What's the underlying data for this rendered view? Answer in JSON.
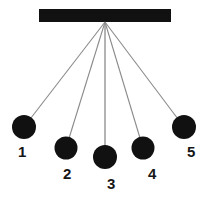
{
  "figure": {
    "type": "physics-diagram",
    "width": 210,
    "height": 199,
    "background_color": "#ffffff"
  },
  "support_bar": {
    "name": "horizontal support bar",
    "color": "#111111",
    "x": 39,
    "y": 9,
    "width": 132,
    "height": 13
  },
  "pivot": {
    "name": "common suspension point",
    "x": 105,
    "y": 22
  },
  "string": {
    "color": "#8a8a8a",
    "width": 1.1
  },
  "bob_color": "#111111",
  "pendulums": [
    {
      "label": "1",
      "bob_cx": 24,
      "bob_cy": 127,
      "bob_r": 12,
      "label_x": 18,
      "label_y": 157
    },
    {
      "label": "2",
      "bob_cx": 66,
      "bob_cy": 148,
      "bob_r": 11.5,
      "label_x": 63,
      "label_y": 179
    },
    {
      "label": "3",
      "bob_cx": 105,
      "bob_cy": 157,
      "bob_r": 12,
      "label_x": 107,
      "label_y": 189
    },
    {
      "label": "4",
      "bob_cx": 143,
      "bob_cy": 148,
      "bob_r": 11.5,
      "label_x": 148,
      "label_y": 179
    },
    {
      "label": "5",
      "bob_cx": 184,
      "bob_cy": 127,
      "bob_r": 12,
      "label_x": 187,
      "label_y": 157
    }
  ]
}
